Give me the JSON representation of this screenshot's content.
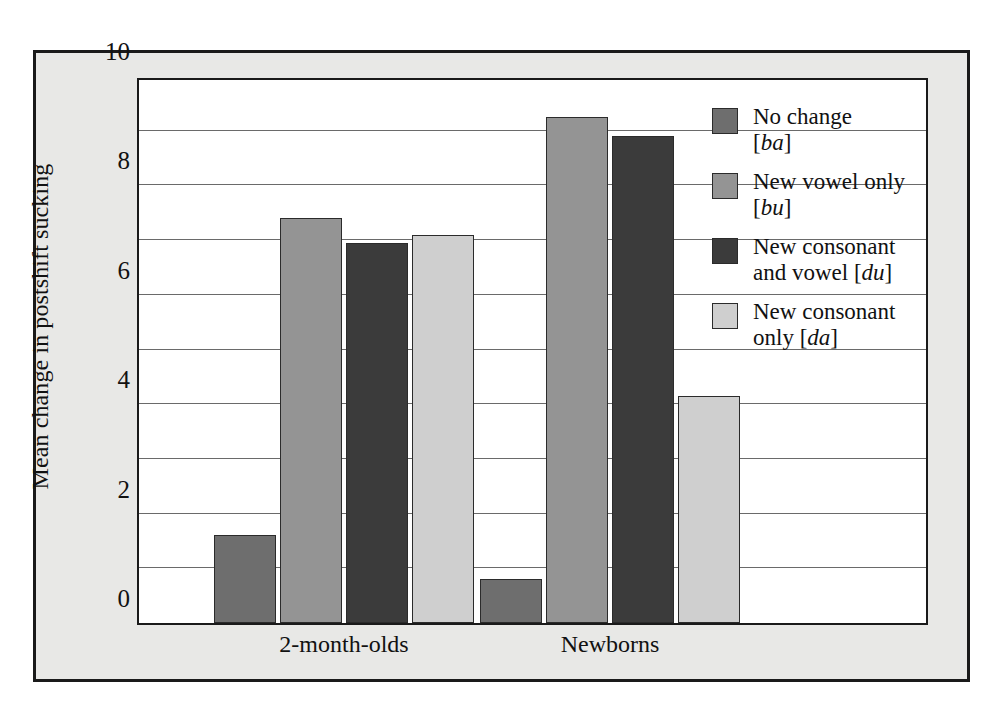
{
  "chart_data": {
    "type": "bar",
    "title": "",
    "xlabel": "",
    "ylabel": "Mean change in postshift sucking",
    "categories": [
      "2-month-olds",
      "Newborns"
    ],
    "ylim": [
      0,
      10
    ],
    "yticks": [
      0,
      2,
      4,
      6,
      8,
      10
    ],
    "ytick_labels": [
      "0",
      "2",
      "4",
      "6",
      "8",
      "10"
    ],
    "gridlines": [
      1,
      2,
      3,
      4,
      5,
      6,
      7,
      8,
      9
    ],
    "grid": true,
    "legend_position": "inside-top-right",
    "series": [
      {
        "name": "No change [ba]",
        "label_line1": "No change",
        "label_line2": "[ba]",
        "phonetic": "ba",
        "color": "#6e6e6e",
        "values": [
          1.6,
          0.8
        ]
      },
      {
        "name": "New vowel only [bu]",
        "label_line1": "New vowel only",
        "label_line2": "[bu]",
        "phonetic": "bu",
        "color": "#949494",
        "values": [
          7.4,
          9.25
        ]
      },
      {
        "name": "New consonant and vowel [du]",
        "label_line1": "New consonant",
        "label_line2": "and vowel [du]",
        "phonetic": "du",
        "color": "#3b3b3b",
        "values": [
          6.95,
          8.9
        ]
      },
      {
        "name": "New consonant only [da]",
        "label_line1": "New consonant",
        "label_line2": "only [da]",
        "phonetic": "da",
        "color": "#cfcfcf",
        "values": [
          7.1,
          4.15
        ]
      }
    ]
  },
  "style": {
    "frame_background": "#e8e8e6",
    "frame_border": "#1a1a1a",
    "plot_background": "#ffffff",
    "gridline_color": "#6a6a6a",
    "text_color": "#111111"
  }
}
